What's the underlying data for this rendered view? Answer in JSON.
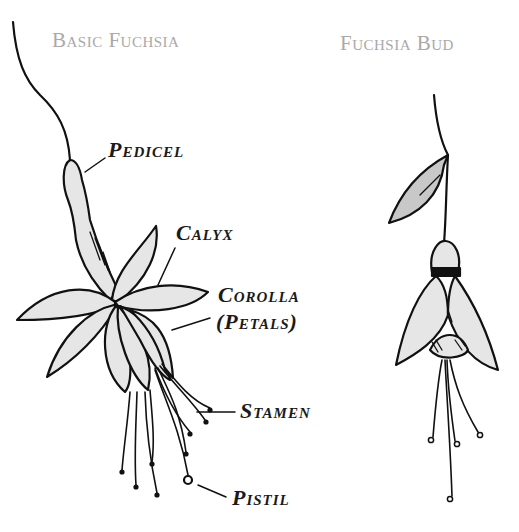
{
  "titles": {
    "left": "Basic Fuchsia",
    "right": "Fuchsia Bud"
  },
  "labels": {
    "pedicel": "Pedicel",
    "calyx": "Calyx",
    "corolla": "Corolla",
    "petals": "(Petals)",
    "stamen": "Stamen",
    "pistil": "Pistil"
  },
  "colors": {
    "title_gray": "#a9a9a9",
    "ink": "#111111",
    "fill_light": "#e6e6e6",
    "leaf_fill": "#c8c8c8"
  }
}
